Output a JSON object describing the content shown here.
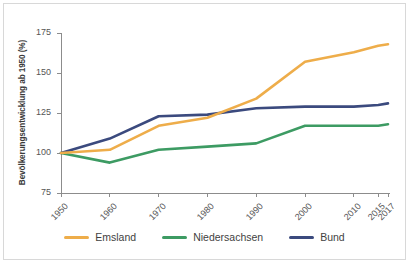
{
  "chart_data": {
    "type": "line",
    "title": "",
    "xlabel": "",
    "ylabel": "Bevölkerungsentwicklung ab 1950 (%)",
    "x": [
      1950,
      1960,
      1970,
      1980,
      1990,
      2000,
      2010,
      2015,
      2017
    ],
    "categories": [
      "1950",
      "1960",
      "1970",
      "1980",
      "1990",
      "2000",
      "2010",
      "2015",
      "2017"
    ],
    "xtick_labels": [
      "1950",
      "1960",
      "1970",
      "1980",
      "1990",
      "2000",
      "2010",
      "2015",
      "2017"
    ],
    "ytick_labels": [
      "75",
      "100",
      "125",
      "150",
      "175"
    ],
    "ytick_values": [
      75,
      100,
      125,
      150,
      175
    ],
    "ylim": [
      75,
      182
    ],
    "xlim": [
      1950,
      2017
    ],
    "grid": false,
    "legend_position": "bottom",
    "series": [
      {
        "name": "Emsland",
        "color": "#eead4a",
        "values": [
          100,
          102,
          117,
          122,
          134,
          157,
          163,
          167,
          168
        ]
      },
      {
        "name": "Niedersachsen",
        "color": "#3d9b63",
        "values": [
          100,
          94,
          102,
          104,
          106,
          117,
          117,
          117,
          118
        ]
      },
      {
        "name": "Bund",
        "color": "#3b4a7e",
        "values": [
          100,
          109,
          123,
          124,
          128,
          129,
          129,
          130,
          131
        ]
      }
    ]
  },
  "legend": {
    "items": [
      {
        "label": "Emsland",
        "color": "#eead4a"
      },
      {
        "label": "Niedersachsen",
        "color": "#3d9b63"
      },
      {
        "label": "Bund",
        "color": "#3b4a7e"
      }
    ]
  },
  "axis": {
    "color": "#8c8c8c",
    "tick_text_color": "#555555"
  }
}
